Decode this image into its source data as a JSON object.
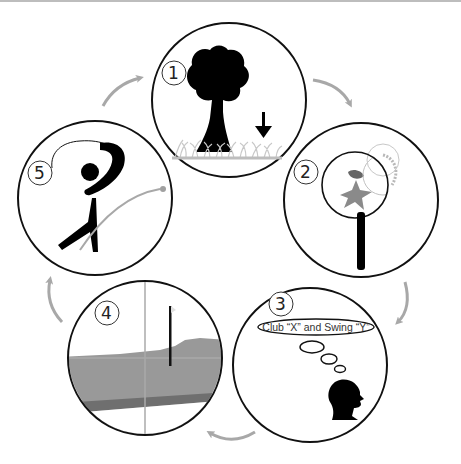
{
  "diagram": {
    "type": "cycle",
    "stroke_color": "#111111",
    "arrow_color": "#a8a8a8",
    "steps": [
      {
        "number": "1",
        "label": "wind-check-tree-grass",
        "icon": "tree-grass-wind-icon"
      },
      {
        "number": "2",
        "label": "magnify-lie",
        "icon": "magnifying-glass-icon"
      },
      {
        "number": "3",
        "label": "Club “X” and Swing “Y”",
        "icon": "thinking-head-icon"
      },
      {
        "number": "4",
        "label": "target-crosshair",
        "icon": "crosshair-flag-icon"
      },
      {
        "number": "5",
        "label": "swing",
        "icon": "golfer-swing-icon"
      }
    ],
    "thought_bubble_text": "Club “X” and Swing “Y”"
  }
}
